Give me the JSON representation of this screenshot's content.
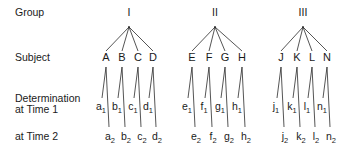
{
  "row_labels": {
    "group": "Group",
    "subject": "Subject",
    "determination_line1": "Determination",
    "determination_line2": "at Time 1",
    "time2": "at Time 2"
  },
  "colors": {
    "ink": "#1a1a1a",
    "lines": "#2a2a2a",
    "background": "#ffffff"
  },
  "layout": {
    "group_label_y": 16,
    "apex_y": 27,
    "subject_label_y": 61,
    "vertex_y": 67,
    "time1_line_end_y": 98,
    "time1_label_y": 110,
    "time2_line_end_y": 127,
    "time2_label_y": 140
  },
  "groups": [
    {
      "label": "I",
      "x": 129,
      "subjects": [
        {
          "name": "A",
          "x": 106,
          "t1": "a",
          "t2": "a"
        },
        {
          "name": "B",
          "x": 122,
          "t1": "b",
          "t2": "b"
        },
        {
          "name": "C",
          "x": 138,
          "t1": "c",
          "t2": "c"
        },
        {
          "name": "D",
          "x": 153,
          "t1": "d",
          "t2": "d"
        }
      ]
    },
    {
      "label": "II",
      "x": 215,
      "subjects": [
        {
          "name": "E",
          "x": 192,
          "t1": "e",
          "t2": "e"
        },
        {
          "name": "F",
          "x": 209,
          "t1": "f",
          "t2": "f"
        },
        {
          "name": "G",
          "x": 225,
          "t1": "g",
          "t2": "g"
        },
        {
          "name": "H",
          "x": 242,
          "t1": "h",
          "t2": "h"
        }
      ]
    },
    {
      "label": "III",
      "x": 303,
      "subjects": [
        {
          "name": "J",
          "x": 281,
          "t1": "j",
          "t2": "j"
        },
        {
          "name": "K",
          "x": 297,
          "t1": "k",
          "t2": "k"
        },
        {
          "name": "L",
          "x": 312,
          "t1": "l",
          "t2": "l"
        },
        {
          "name": "N",
          "x": 327,
          "t1": "n",
          "t2": "n"
        }
      ]
    }
  ],
  "subscripts": {
    "time1": "1",
    "time2": "2"
  }
}
